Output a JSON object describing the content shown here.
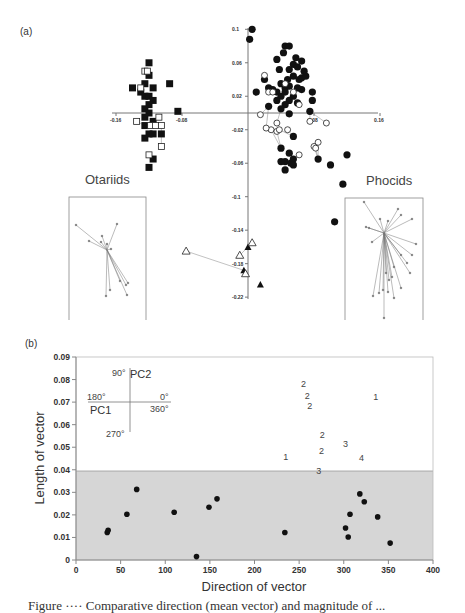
{
  "chart_data": [
    {
      "panel": "(a)",
      "type": "scatter",
      "title": "",
      "xlabel": "",
      "ylabel": "",
      "x_ticks": [
        "-0.16",
        "-0.08",
        "0.08",
        "0.16"
      ],
      "y_ticks": [
        "0.1",
        "0.06",
        "0.02",
        "-0.02",
        "-0.06",
        "-0.1",
        "-0.14",
        "-0.18",
        "-0.22"
      ],
      "xlim": [
        -0.16,
        0.16
      ],
      "ylim": [
        -0.22,
        0.1
      ],
      "grid": false,
      "group_labels": [
        "Otariids",
        "Phocids"
      ],
      "series": [
        {
          "name": "Otariids (filled squares)",
          "marker": "filled-square",
          "points": [
            [
              -0.12,
              0.06
            ],
            [
              -0.12,
              0.045
            ],
            [
              -0.125,
              0.035
            ],
            [
              -0.115,
              0.03
            ],
            [
              -0.14,
              0.03
            ],
            [
              -0.13,
              0.025
            ],
            [
              -0.125,
              0.02
            ],
            [
              -0.12,
              0.02
            ],
            [
              -0.115,
              0.015
            ],
            [
              -0.12,
              0.01
            ],
            [
              -0.125,
              0.005
            ],
            [
              -0.12,
              0.0
            ],
            [
              -0.125,
              -0.005
            ],
            [
              -0.115,
              -0.01
            ],
            [
              -0.125,
              -0.015
            ],
            [
              -0.12,
              -0.025
            ],
            [
              -0.115,
              -0.025
            ],
            [
              -0.125,
              -0.03
            ],
            [
              -0.105,
              -0.025
            ],
            [
              -0.115,
              -0.055
            ],
            [
              -0.12,
              -0.065
            ],
            [
              -0.095,
              0.035
            ],
            [
              -0.085,
              0.002
            ]
          ]
        },
        {
          "name": "Otariids (open squares)",
          "marker": "open-square",
          "points": [
            [
              -0.125,
              0.05
            ],
            [
              -0.122,
              0.05
            ],
            [
              -0.13,
              0.03
            ],
            [
              -0.135,
              -0.01
            ],
            [
              -0.118,
              -0.015
            ],
            [
              -0.112,
              -0.015
            ],
            [
              -0.108,
              -0.005
            ],
            [
              -0.105,
              -0.015
            ],
            [
              -0.105,
              -0.04
            ],
            [
              -0.12,
              -0.05
            ]
          ]
        },
        {
          "name": "Phocids (filled circles)",
          "marker": "filled-circle",
          "points": [
            [
              0.005,
              0.1
            ],
            [
              0.002,
              0.088
            ],
            [
              0.045,
              0.08
            ],
            [
              0.05,
              0.08
            ],
            [
              0.043,
              0.072
            ],
            [
              0.035,
              0.064
            ],
            [
              0.058,
              0.066
            ],
            [
              0.065,
              0.062
            ],
            [
              0.055,
              0.058
            ],
            [
              0.038,
              0.052
            ],
            [
              0.05,
              0.052
            ],
            [
              0.06,
              0.055
            ],
            [
              0.068,
              0.05
            ],
            [
              0.055,
              0.044
            ],
            [
              0.062,
              0.04
            ],
            [
              0.065,
              0.042
            ],
            [
              0.07,
              0.044
            ],
            [
              0.048,
              0.04
            ],
            [
              0.02,
              0.04
            ],
            [
              0.04,
              0.035
            ],
            [
              0.045,
              0.03
            ],
            [
              0.05,
              0.032
            ],
            [
              0.035,
              0.025
            ],
            [
              0.03,
              0.028
            ],
            [
              0.025,
              0.03
            ],
            [
              0.06,
              0.03
            ],
            [
              0.065,
              0.028
            ],
            [
              0.045,
              0.025
            ],
            [
              0.055,
              0.02
            ],
            [
              0.04,
              0.02
            ],
            [
              0.035,
              0.015
            ],
            [
              0.05,
              0.015
            ],
            [
              0.045,
              0.01
            ],
            [
              0.06,
              0.012
            ],
            [
              0.078,
              0.025
            ],
            [
              0.078,
              0.015
            ],
            [
              0.075,
              0.002
            ],
            [
              0.01,
              0.025
            ],
            [
              0.025,
              0.008
            ],
            [
              0.04,
              0.005
            ],
            [
              0.05,
              -0.001
            ],
            [
              0.055,
              -0.028
            ],
            [
              0.04,
              -0.042
            ],
            [
              0.05,
              -0.048
            ],
            [
              0.045,
              -0.058
            ],
            [
              0.052,
              -0.06
            ],
            [
              0.055,
              -0.055
            ],
            [
              0.04,
              -0.058
            ],
            [
              0.045,
              -0.068
            ],
            [
              0.055,
              -0.062
            ],
            [
              0.085,
              -0.055
            ],
            [
              0.1,
              -0.062
            ],
            [
              0.12,
              -0.05
            ],
            [
              0.115,
              -0.085
            ],
            [
              0.105,
              -0.13
            ]
          ]
        },
        {
          "name": "Phocids (open circles)",
          "marker": "open-circle",
          "points": [
            [
              0.02,
              0.045
            ],
            [
              0.025,
              0.025
            ],
            [
              0.03,
              0.025
            ],
            [
              0.015,
              -0.002
            ],
            [
              0.045,
              0.035
            ],
            [
              0.055,
              0.025
            ],
            [
              0.062,
              0.01
            ],
            [
              0.075,
              -0.01
            ],
            [
              0.095,
              -0.012
            ],
            [
              0.035,
              -0.012
            ],
            [
              0.028,
              -0.02
            ],
            [
              0.035,
              -0.022
            ],
            [
              0.038,
              -0.02
            ],
            [
              0.048,
              -0.02
            ],
            [
              0.022,
              -0.018
            ],
            [
              0.08,
              -0.04
            ],
            [
              0.082,
              -0.042
            ],
            [
              0.085,
              -0.035
            ],
            [
              0.062,
              -0.05
            ]
          ]
        },
        {
          "name": "Outgroup (filled triangles)",
          "marker": "filled-triangle",
          "points": [
            [
              -0.0,
              -0.16
            ],
            [
              -0.005,
              -0.188
            ],
            [
              0.015,
              -0.205
            ]
          ]
        },
        {
          "name": "Outgroup (open triangles)",
          "marker": "open-triangle",
          "points": [
            [
              -0.075,
              -0.165
            ],
            [
              -0.01,
              -0.17
            ],
            [
              0.005,
              -0.155
            ],
            [
              -0.003,
              -0.192
            ]
          ]
        }
      ]
    },
    {
      "panel": "(b)",
      "type": "scatter",
      "title": "",
      "xlabel": "Direction of vector",
      "ylabel": "Length of vector",
      "x_ticks": [
        "0",
        "50",
        "100",
        "150",
        "200",
        "250",
        "300",
        "350",
        "400"
      ],
      "y_ticks": [
        "0",
        "0.01",
        "0.02",
        "0.03",
        "0.04",
        "0.05",
        "0.06",
        "0.07",
        "0.08",
        "0.09"
      ],
      "xlim": [
        0,
        400
      ],
      "ylim": [
        0,
        0.09
      ],
      "grid": false,
      "shaded_region": {
        "y_from": 0,
        "y_to": 0.0395,
        "color": "#d4d4d4"
      },
      "compass_inset": {
        "labels": [
          "90°",
          "PC2",
          "180°",
          "0°",
          "360°",
          "PC1",
          "270°"
        ]
      },
      "series": [
        {
          "name": "below threshold",
          "marker": "filled-circle",
          "points": [
            [
              35,
              0.0122
            ],
            [
              36,
              0.0132
            ],
            [
              57,
              0.0203
            ],
            [
              68,
              0.0313
            ],
            [
              110,
              0.0212
            ],
            [
              135,
              0.0015
            ],
            [
              149,
              0.0234
            ],
            [
              158,
              0.0271
            ],
            [
              234,
              0.0122
            ],
            [
              302,
              0.0142
            ],
            [
              305,
              0.0102
            ],
            [
              307,
              0.0203
            ],
            [
              318,
              0.0293
            ],
            [
              323,
              0.0258
            ],
            [
              338,
              0.0191
            ],
            [
              352,
              0.0075
            ]
          ]
        },
        {
          "name": "labeled vectors",
          "marker": "number",
          "points": [
            [
              255,
              0.078,
              "2"
            ],
            [
              259,
              0.0725,
              "2"
            ],
            [
              262,
              0.0683,
              "2"
            ],
            [
              336,
              0.0723,
              "1"
            ],
            [
              276,
              0.0556,
              "2"
            ],
            [
              302,
              0.0515,
              "3"
            ],
            [
              275,
              0.0482,
              "2"
            ],
            [
              235,
              0.0455,
              "1"
            ],
            [
              320,
              0.0452,
              "4"
            ],
            [
              272,
              0.0393,
              "3"
            ]
          ]
        }
      ]
    }
  ],
  "panels": {
    "a": {
      "label": "(a)",
      "otariids": "Otariids",
      "phocids": "Phocids"
    },
    "b": {
      "label": "(b)",
      "xlabel": "Direction of vector",
      "ylabel": "Length of vector",
      "compass": {
        "north": "90°",
        "north_axis": "PC2",
        "west": "180°",
        "east_top": "0°",
        "east_bottom": "360°",
        "west_axis": "PC1",
        "south": "270°"
      }
    }
  },
  "caption": {
    "text": "Figure ···· Comparative direction (mean vector) and magnitude of ..."
  }
}
